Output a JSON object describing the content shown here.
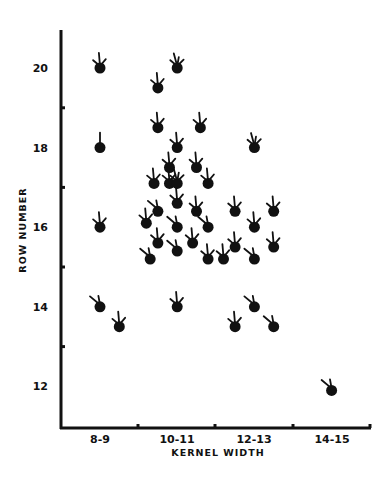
{
  "chart_data": {
    "type": "scatter",
    "title": "",
    "xlabel": "KERNEL WIDTH",
    "ylabel": "ROW NUMBER",
    "x_categories": [
      "8-9",
      "10-11",
      "12-13",
      "14-15"
    ],
    "y_ticks": [
      12,
      14,
      16,
      18,
      20
    ],
    "ylim": [
      11,
      21
    ],
    "grid": false,
    "legend": null,
    "marker": "pictograph: filled dot with upward-radiating rays (glyph)",
    "points": [
      {
        "category": "8-9",
        "x": 8.5,
        "y": 20,
        "rays": 3
      },
      {
        "category": "8-9",
        "x": 8.5,
        "y": 18,
        "rays": 1
      },
      {
        "category": "8-9",
        "x": 8.5,
        "y": 16,
        "rays": 3
      },
      {
        "category": "8-9",
        "x": 8.5,
        "y": 14,
        "rays": 2
      },
      {
        "category": "8-9",
        "x": 9.0,
        "y": 13.5,
        "rays": 3
      },
      {
        "category": "10-11",
        "x": 10.0,
        "y": 19.5,
        "rays": 3
      },
      {
        "category": "10-11",
        "x": 10.5,
        "y": 20,
        "rays": 4
      },
      {
        "category": "10-11",
        "x": 10.0,
        "y": 18.5,
        "rays": 3
      },
      {
        "category": "10-11",
        "x": 11.1,
        "y": 18.5,
        "rays": 3
      },
      {
        "category": "10-11",
        "x": 10.5,
        "y": 18,
        "rays": 3
      },
      {
        "category": "10-11",
        "x": 10.3,
        "y": 17.5,
        "rays": 3
      },
      {
        "category": "10-11",
        "x": 9.9,
        "y": 17.1,
        "rays": 3
      },
      {
        "category": "10-11",
        "x": 10.3,
        "y": 17.1,
        "rays": 3
      },
      {
        "category": "10-11",
        "x": 10.5,
        "y": 17.1,
        "rays": 4
      },
      {
        "category": "10-11",
        "x": 11.0,
        "y": 17.5,
        "rays": 3
      },
      {
        "category": "10-11",
        "x": 11.3,
        "y": 17.1,
        "rays": 3
      },
      {
        "category": "10-11",
        "x": 10.5,
        "y": 16.6,
        "rays": 3
      },
      {
        "category": "10-11",
        "x": 10.0,
        "y": 16.4,
        "rays": 2
      },
      {
        "category": "10-11",
        "x": 11.0,
        "y": 16.4,
        "rays": 3
      },
      {
        "category": "10-11",
        "x": 9.7,
        "y": 16.1,
        "rays": 3
      },
      {
        "category": "10-11",
        "x": 10.5,
        "y": 16,
        "rays": 2
      },
      {
        "category": "10-11",
        "x": 11.3,
        "y": 16,
        "rays": 2
      },
      {
        "category": "10-11",
        "x": 10.0,
        "y": 15.6,
        "rays": 3
      },
      {
        "category": "10-11",
        "x": 10.9,
        "y": 15.6,
        "rays": 3
      },
      {
        "category": "10-11",
        "x": 9.8,
        "y": 15.2,
        "rays": 2
      },
      {
        "category": "10-11",
        "x": 10.5,
        "y": 15.4,
        "rays": 2
      },
      {
        "category": "10-11",
        "x": 10.5,
        "y": 14,
        "rays": 3
      },
      {
        "category": "10-11",
        "x": 11.3,
        "y": 15.2,
        "rays": 3
      },
      {
        "category": "10-11",
        "x": 11.7,
        "y": 15.2,
        "rays": 3
      },
      {
        "category": "12-13",
        "x": 12.5,
        "y": 18,
        "rays": 4
      },
      {
        "category": "12-13",
        "x": 12.0,
        "y": 16.4,
        "rays": 3
      },
      {
        "category": "12-13",
        "x": 13.0,
        "y": 16.4,
        "rays": 3
      },
      {
        "category": "12-13",
        "x": 12.5,
        "y": 16,
        "rays": 3
      },
      {
        "category": "12-13",
        "x": 12.0,
        "y": 15.5,
        "rays": 3
      },
      {
        "category": "12-13",
        "x": 13.0,
        "y": 15.5,
        "rays": 3
      },
      {
        "category": "12-13",
        "x": 12.5,
        "y": 15.2,
        "rays": 2
      },
      {
        "category": "12-13",
        "x": 12.5,
        "y": 14,
        "rays": 2
      },
      {
        "category": "12-13",
        "x": 12.0,
        "y": 13.5,
        "rays": 3
      },
      {
        "category": "12-13",
        "x": 13.0,
        "y": 13.5,
        "rays": 2
      },
      {
        "category": "14-15",
        "x": 14.5,
        "y": 11.9,
        "rays": 2
      }
    ]
  }
}
